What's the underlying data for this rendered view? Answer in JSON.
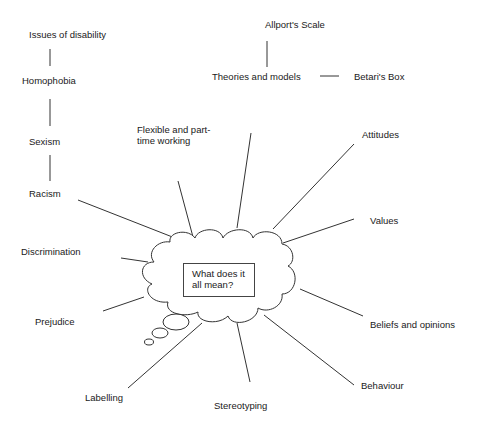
{
  "diagram": {
    "type": "mind-map",
    "center": {
      "line1": "What does it",
      "line2": "all mean?"
    },
    "left_chain": [
      "Issues of disability",
      "Homophobia",
      "Sexism",
      "Racism"
    ],
    "theories": {
      "title": "Theories and models",
      "children": [
        "Allport's Scale",
        "Betari's Box"
      ]
    },
    "nodes": {
      "flexible_line1": "Flexible and part-",
      "flexible_line2": "time working",
      "attitudes": "Attitudes",
      "values": "Values",
      "discrimination": "Discrimination",
      "prejudice": "Prejudice",
      "beliefs": "Beliefs and opinions",
      "behaviour": "Behaviour",
      "labelling": "Labelling",
      "stereotyping": "Stereotyping"
    },
    "colors": {
      "line": "#333333",
      "text": "#1a1a1a",
      "background": "#ffffff"
    }
  }
}
